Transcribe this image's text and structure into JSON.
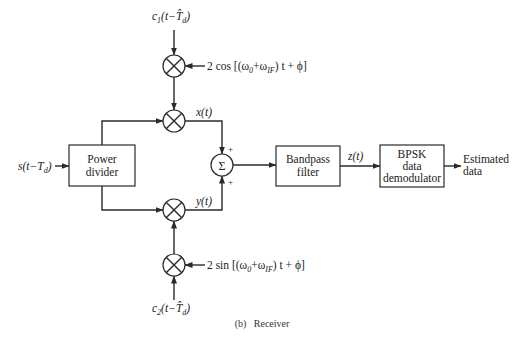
{
  "diagram": {
    "caption": "(b)   Receiver",
    "input_signal": "s(t−T",
    "input_signal_sub": "d",
    "input_signal_close": ")",
    "top_code": "c",
    "top_code_sub1": "1",
    "top_code_mid": "(t−",
    "top_code_T": "T̂",
    "top_code_sub2": "d",
    "top_code_close": ")",
    "bottom_code": "c",
    "bottom_code_sub1": "2",
    "bottom_code_mid": "(t−",
    "bottom_code_T": "T̂",
    "bottom_code_sub2": "d",
    "bottom_code_close": ")",
    "cos_ref": "2 cos [(ω",
    "cos_ref_sub0": "0",
    "cos_ref_plus": "+ω",
    "cos_ref_subIF": "IF",
    "cos_ref_end": ") t + ϕ]",
    "sin_ref": "2 sin [(ω",
    "sin_ref_sub0": "0",
    "sin_ref_plus": "+ω",
    "sin_ref_subIF": "IF",
    "sin_ref_end": ") t + ϕ]",
    "x_label": "x(t)",
    "y_label": "y(t)",
    "z_label": "z(t)",
    "sum_symbol": "Σ",
    "plus_top": "+",
    "plus_bottom": "+",
    "blocks": {
      "power_divider": [
        "Power",
        "divider"
      ],
      "bandpass_filter": [
        "Bandpass",
        "filter"
      ],
      "bpsk_demod": [
        "BPSK",
        "data",
        "demodulator"
      ]
    },
    "output": [
      "Estimated",
      "data"
    ]
  }
}
